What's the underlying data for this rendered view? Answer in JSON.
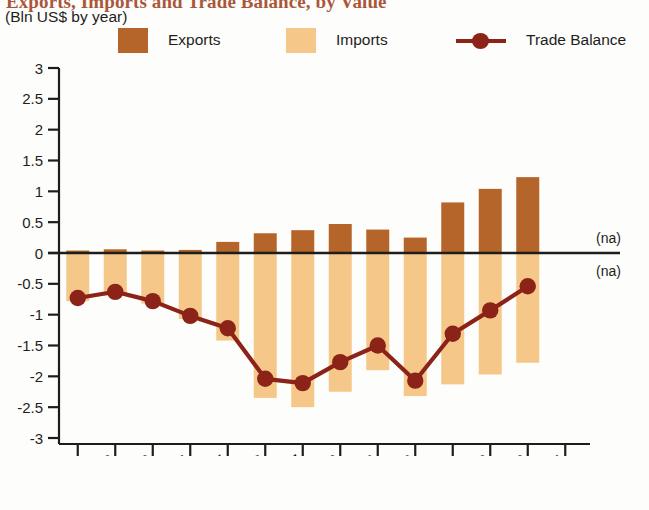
{
  "header": {
    "title": "Exports, Imports and Trade Balance, by Value",
    "subtitle": "(Bln US$ by year)"
  },
  "legend": {
    "items": [
      {
        "label": "Exports",
        "type": "swatch",
        "color": "#b5652a"
      },
      {
        "label": "Imports",
        "type": "swatch",
        "color": "#f5c889"
      },
      {
        "label": "Trade Balance",
        "type": "line-marker",
        "color": "#8b2318"
      }
    ]
  },
  "annotations": {
    "na_above": "(na)",
    "na_below": "(na)"
  },
  "chart_data": {
    "type": "bar",
    "title": "Exports, Imports and Trade Balance, by Value",
    "subtitle": "(Bln US$ by year)",
    "xlabel": "",
    "ylabel": "Bln US$",
    "ylim": [
      -3,
      3
    ],
    "ytick_labels": [
      "3",
      "2.5",
      "2",
      "1.5",
      "1",
      "0.5",
      "0",
      "-0.5",
      "-1",
      "-1.5",
      "-2",
      "-2.5",
      "-3"
    ],
    "ytick_values": [
      3,
      2.5,
      2,
      1.5,
      1,
      0.5,
      0,
      -0.5,
      -1,
      -1.5,
      -2,
      -2.5,
      -3
    ],
    "grid": false,
    "legend_position": "top",
    "categories": [
      "2001",
      "2002",
      "2003",
      "2004",
      "2005",
      "2006",
      "2007",
      "2008",
      "2009",
      "2010",
      "2011",
      "2012",
      "2013",
      "2014"
    ],
    "series": [
      {
        "name": "Exports",
        "type": "bar",
        "color": "#b5652a",
        "values": [
          0.04,
          0.06,
          0.04,
          0.05,
          0.18,
          0.32,
          0.37,
          0.47,
          0.38,
          0.25,
          0.82,
          1.04,
          1.23,
          null
        ]
      },
      {
        "name": "Imports",
        "type": "bar",
        "color": "#f5c889",
        "values": [
          -0.78,
          -0.69,
          -0.82,
          -1.07,
          -1.42,
          -2.35,
          -2.5,
          -2.25,
          -1.9,
          -2.32,
          -2.13,
          -1.97,
          -1.78,
          null
        ]
      },
      {
        "name": "Trade Balance",
        "type": "line",
        "color": "#8b2318",
        "values": [
          -0.73,
          -0.63,
          -0.78,
          -1.02,
          -1.22,
          -2.04,
          -2.11,
          -1.77,
          -1.5,
          -2.07,
          -1.31,
          -0.93,
          -0.54,
          null
        ]
      }
    ],
    "notes": [
      "2014 Exports value not available (na)",
      "2014 Imports value not available (na)"
    ]
  }
}
